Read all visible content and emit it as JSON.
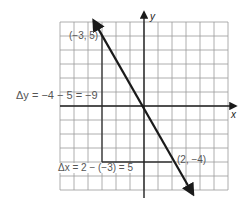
{
  "diagram": {
    "type": "slope-diagram",
    "grid": {
      "xmin": -6,
      "xmax": 6,
      "ymin": -6,
      "ymax": 6,
      "cell_px": 14,
      "origin_px": [
        144,
        106
      ],
      "grid_color": "#9a9a9a",
      "axis_color": "#222222"
    },
    "axes": {
      "x_label": "x",
      "y_label": "y"
    },
    "line": {
      "from": [
        -3.6,
        6.1
      ],
      "to": [
        3.5,
        -6.3
      ],
      "color": "#1a1a1a",
      "arrows": "both"
    },
    "points": [
      {
        "coords": [
          -3,
          5
        ],
        "label": "(−3, 5)"
      },
      {
        "coords": [
          2,
          -4
        ],
        "label": "(2, −4)"
      }
    ],
    "annotations": {
      "delta_y": "Δy = −4 − 5 = −9",
      "delta_x": "Δx = 2 − (−3) = 5"
    },
    "rise_run_lines": {
      "vertical": {
        "x": -3,
        "from_y": 5,
        "to_y": -4
      },
      "horizontal": {
        "y": -4,
        "from_x": -3,
        "to_x": 2
      }
    }
  }
}
